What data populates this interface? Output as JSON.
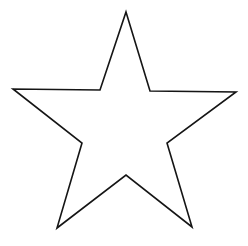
{
  "canvas": {
    "width": 248,
    "height": 246,
    "background_color": "#ffffff",
    "description": "star-outline-line-drawing"
  },
  "figure": {
    "name": "five-pointed-star",
    "shape_type": "polygon",
    "fill": "none",
    "fill_color": "#ffffff",
    "stroke_color": "#151515",
    "stroke_width": 1.6,
    "point_count": 5,
    "vertex_count": 10,
    "orientation": "point-up",
    "vertices": [
      {
        "label": "outer-top",
        "kind": "outer",
        "x": 126,
        "y": 12
      },
      {
        "label": "inner-upper-right",
        "kind": "inner",
        "x": 150,
        "y": 91
      },
      {
        "label": "outer-right",
        "kind": "outer",
        "x": 236,
        "y": 92
      },
      {
        "label": "inner-right",
        "kind": "inner",
        "x": 167,
        "y": 143
      },
      {
        "label": "outer-bottom-right",
        "kind": "outer",
        "x": 192,
        "y": 227
      },
      {
        "label": "inner-bottom",
        "kind": "inner",
        "x": 126,
        "y": 175
      },
      {
        "label": "outer-bottom-left",
        "kind": "outer",
        "x": 57,
        "y": 228
      },
      {
        "label": "inner-left",
        "kind": "inner",
        "x": 82,
        "y": 143
      },
      {
        "label": "outer-left",
        "kind": "outer",
        "x": 13,
        "y": 89
      },
      {
        "label": "inner-upper-left",
        "kind": "inner",
        "x": 100,
        "y": 90
      }
    ],
    "points_attr": "126,12 150,91 236,92 167,143 192,227 126,175 57,228 82,143 13,89 100,90"
  }
}
